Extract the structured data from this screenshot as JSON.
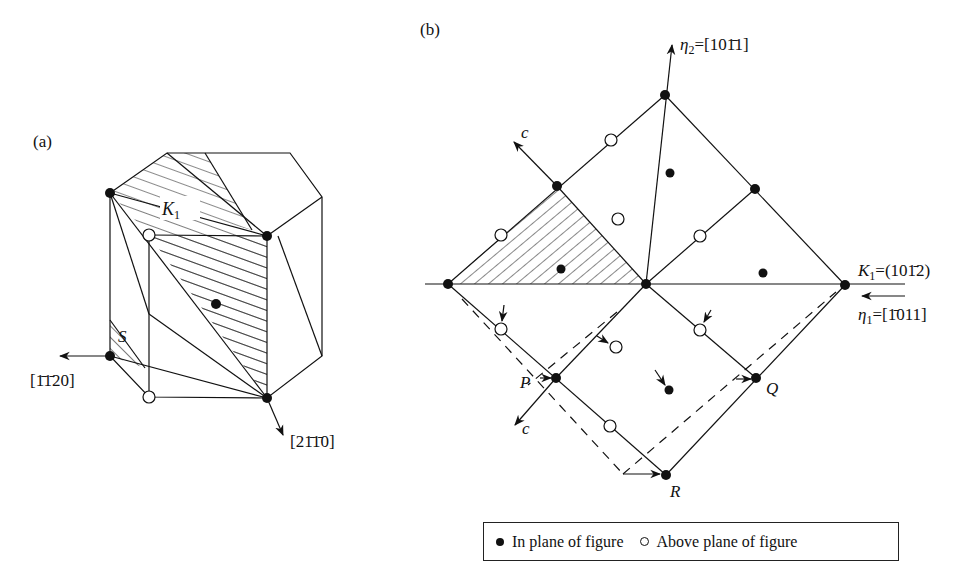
{
  "figure": {
    "panel_a": {
      "label": "(a)",
      "plane_label": "K",
      "plane_sub": "1",
      "s_label": "S",
      "dir_left": "[1̄1̄20]",
      "dir_bottom": "[21̄1̄0]"
    },
    "panel_b": {
      "label": "(b)",
      "eta2_sym": "η",
      "eta2_sub": "2",
      "eta2_val": "=[101̄1]",
      "k1_sym": "K",
      "k1_sub": "1",
      "k1_val": "=(101̄2)",
      "eta1_sym": "η",
      "eta1_sub": "1",
      "eta1_val": "=[1̄011]",
      "c_upper": "c",
      "c_lower": "c",
      "point_p": "P",
      "point_q": "Q",
      "point_r": "R"
    },
    "legend": {
      "filled": "In plane of figure",
      "open": "Above plane of figure"
    },
    "colors": {
      "ink": "#111111",
      "background": "#ffffff"
    }
  }
}
